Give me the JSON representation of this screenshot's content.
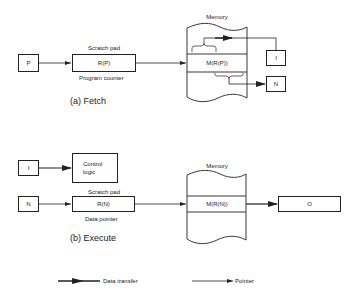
{
  "fetch": {
    "caption": "(a) Fetch",
    "input_box": "P",
    "scratch_pad_label": "Scratch pad",
    "register": "R(P)",
    "register_sublabel": "Program counter",
    "memory_label": "Memory",
    "memory_cell": "M(R(P))",
    "output_top": "I",
    "output_bottom": "N"
  },
  "execute": {
    "caption": "(b) Execute",
    "instruction_box": "I",
    "control_logic": [
      "Control",
      "logic"
    ],
    "input_box": "N",
    "scratch_pad_label": "Scratch pad",
    "register": "R(N)",
    "register_sublabel": "Data pointer",
    "memory_label": "Memory",
    "memory_cell": "M(R(N))",
    "output_box": "O"
  },
  "legend": {
    "data_transfer": "Data transfer",
    "pointer": "Pointer"
  },
  "colors": {
    "line": "#222222",
    "background": "#ffffff"
  }
}
